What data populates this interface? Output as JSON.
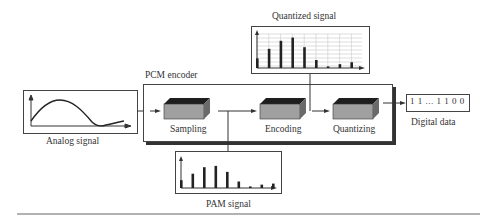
{
  "diagram": {
    "encoder_label": "PCM encoder",
    "analog": {
      "label": "Analog signal"
    },
    "stages": [
      {
        "id": "sampling",
        "label": "Sampling"
      },
      {
        "id": "encoding",
        "label": "Encoding"
      },
      {
        "id": "quantizing",
        "label": "Quantizing"
      }
    ],
    "digital": {
      "value": "1 1 ... 1 1 0 0",
      "label": "Digital data"
    },
    "quantized": {
      "label": "Quantized signal",
      "bars": [
        0.3,
        0.6,
        0.85,
        0.95,
        0.65,
        0.25,
        0.05,
        0.12,
        0.18
      ]
    },
    "pam": {
      "label": "PAM signal",
      "bars": [
        0.3,
        0.55,
        0.8,
        0.85,
        0.62,
        0.25,
        0.06,
        0.13,
        0.17
      ]
    }
  },
  "colors": {
    "line": "#333333",
    "block_top": "#1e1e1e",
    "block_front": "#a0a0a0",
    "block_side": "#6a6a6a",
    "grid": "#c8c8c8"
  }
}
